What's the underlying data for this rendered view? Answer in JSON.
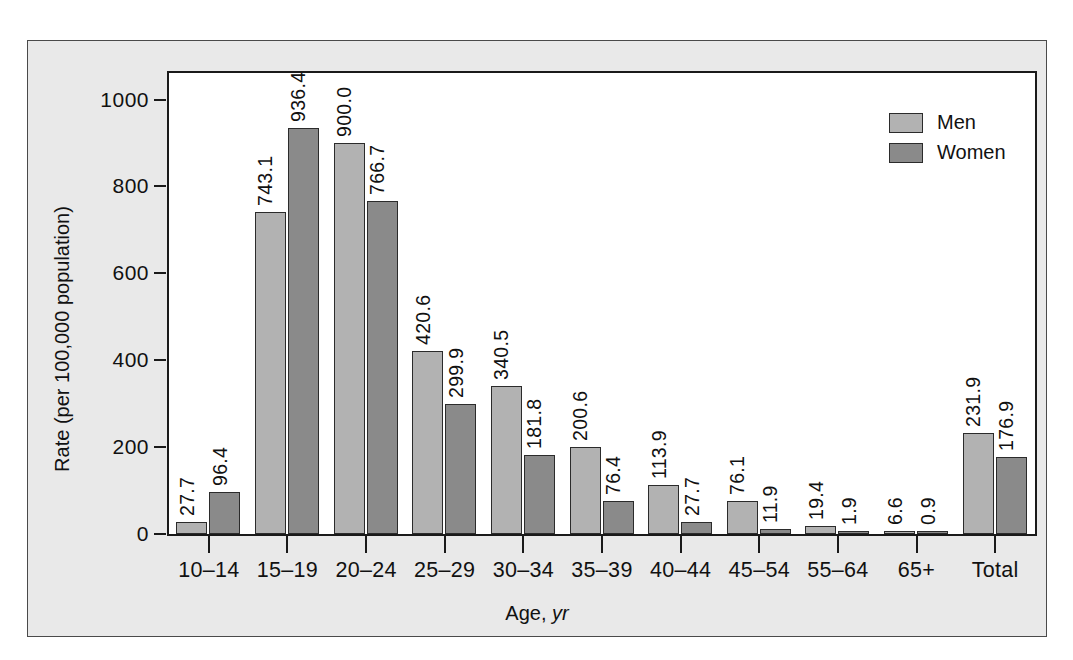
{
  "chart_data": {
    "type": "bar",
    "title": "",
    "xlabel": "Age, yr",
    "xlabel_plain": "Age,",
    "xlabel_italic": "yr",
    "ylabel": "Rate (per 100,000 population)",
    "ylim": [
      0,
      1060
    ],
    "yticks": [
      0,
      200,
      400,
      600,
      800,
      1000
    ],
    "ytick_labels": [
      "0",
      "200",
      "400",
      "600",
      "800",
      "1000"
    ],
    "grid": false,
    "legend_position": "top-right",
    "categories": [
      "10–14",
      "15–19",
      "20–24",
      "25–29",
      "30–34",
      "35–39",
      "40–44",
      "45–54",
      "55–64",
      "65+",
      "Total"
    ],
    "series": [
      {
        "name": "Men",
        "color": "#b2b2b2",
        "values": [
          27.7,
          743.1,
          900.0,
          420.6,
          340.5,
          200.6,
          113.9,
          76.1,
          19.4,
          6.6,
          231.9
        ],
        "labels": [
          "27.7",
          "743.1",
          "900.0",
          "420.6",
          "340.5",
          "200.6",
          "113.9",
          "76.1",
          "19.4",
          "6.6",
          "231.9"
        ]
      },
      {
        "name": "Women",
        "color": "#8a8a8a",
        "values": [
          96.4,
          936.4,
          766.7,
          299.9,
          181.8,
          76.4,
          27.7,
          11.9,
          1.9,
          0.9,
          176.9
        ],
        "labels": [
          "96.4",
          "936.4",
          "766.7",
          "299.9",
          "181.8",
          "76.4",
          "27.7",
          "11.9",
          "1.9",
          "0.9",
          "176.9"
        ]
      }
    ]
  },
  "legend": {
    "items": [
      {
        "label": "Men",
        "color": "#b2b2b2"
      },
      {
        "label": "Women",
        "color": "#8a8a8a"
      }
    ]
  }
}
